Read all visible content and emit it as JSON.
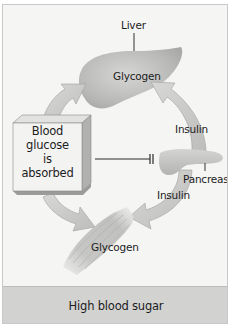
{
  "diagram": {
    "title": "High blood sugar",
    "organs": {
      "liver": {
        "label": "Liver",
        "content": "Glycogen"
      },
      "pancreas": {
        "label": "Pancreas"
      },
      "muscle": {
        "content": "Glycogen"
      }
    },
    "box": {
      "lines": [
        "Blood",
        "glucose",
        "is",
        "absorbed"
      ]
    },
    "arrows": {
      "pancreas_to_liver": "Insulin",
      "pancreas_to_muscle": "Insulin"
    },
    "inhibition_link": "Blood glucose absorbed inhibits pancreas"
  },
  "colors": {
    "background": "#f5f5f4",
    "arrow_fill": "#c9c9c8",
    "organ_fill": "#bdbdbc",
    "footer": "#d2d2d1",
    "text": "#1c1c1c"
  }
}
